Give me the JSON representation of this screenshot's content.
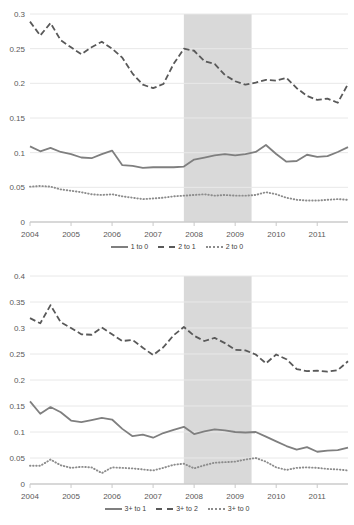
{
  "chart_data": [
    {
      "type": "line",
      "title": "",
      "xlabel": "",
      "ylabel": "",
      "xlim": [
        2004.0,
        2011.75
      ],
      "ylim": [
        0,
        0.3
      ],
      "yticks": [
        "0",
        "0.05",
        "0.1",
        "0.15",
        "0.2",
        "0.25",
        "0.3"
      ],
      "ytick_values": [
        0,
        0.05,
        0.1,
        0.15,
        0.2,
        0.25,
        0.3
      ],
      "xticks": [
        "2004",
        "2005",
        "2006",
        "2007",
        "2008",
        "2009",
        "2010",
        "2011"
      ],
      "xtick_values": [
        2004,
        2005,
        2006,
        2007,
        2008,
        2009,
        2010,
        2011
      ],
      "grid": "horizontal",
      "legend_position": "bottom",
      "shaded_region": {
        "start": 2007.75,
        "end": 2009.4,
        "color": "#d9d9d9"
      },
      "x": [
        2004.0,
        2004.25,
        2004.5,
        2004.75,
        2005.0,
        2005.25,
        2005.5,
        2005.75,
        2006.0,
        2006.25,
        2006.5,
        2006.75,
        2007.0,
        2007.25,
        2007.5,
        2007.75,
        2008.0,
        2008.25,
        2008.5,
        2008.75,
        2009.0,
        2009.25,
        2009.5,
        2009.75,
        2010.0,
        2010.25,
        2010.5,
        2010.75,
        2011.0,
        2011.25,
        2011.5,
        2011.75
      ],
      "series": [
        {
          "name": "1 to 0",
          "style": "solid",
          "color": "#7f7f7f",
          "values": [
            0.109,
            0.102,
            0.107,
            0.101,
            0.098,
            0.093,
            0.092,
            0.098,
            0.103,
            0.082,
            0.081,
            0.078,
            0.079,
            0.079,
            0.079,
            0.08,
            0.09,
            0.093,
            0.096,
            0.098,
            0.096,
            0.098,
            0.101,
            0.111,
            0.098,
            0.087,
            0.088,
            0.097,
            0.094,
            0.095,
            0.101,
            0.108
          ]
        },
        {
          "name": "2 to 1",
          "style": "dashed",
          "color": "#595959",
          "values": [
            0.289,
            0.269,
            0.287,
            0.262,
            0.252,
            0.242,
            0.252,
            0.26,
            0.25,
            0.237,
            0.214,
            0.198,
            0.193,
            0.199,
            0.228,
            0.25,
            0.247,
            0.232,
            0.228,
            0.212,
            0.203,
            0.198,
            0.201,
            0.205,
            0.204,
            0.208,
            0.193,
            0.182,
            0.176,
            0.178,
            0.172,
            0.199
          ]
        },
        {
          "name": "2 to 0",
          "style": "dotted",
          "color": "#8c8c8c",
          "values": [
            0.051,
            0.052,
            0.051,
            0.047,
            0.045,
            0.043,
            0.04,
            0.039,
            0.04,
            0.037,
            0.035,
            0.033,
            0.034,
            0.035,
            0.037,
            0.038,
            0.039,
            0.04,
            0.038,
            0.039,
            0.038,
            0.038,
            0.039,
            0.043,
            0.04,
            0.035,
            0.032,
            0.031,
            0.031,
            0.032,
            0.033,
            0.032
          ]
        }
      ]
    },
    {
      "type": "line",
      "title": "",
      "xlabel": "",
      "ylabel": "",
      "xlim": [
        2004.0,
        2011.75
      ],
      "ylim": [
        0,
        0.4
      ],
      "yticks": [
        "0",
        "0.05",
        "0.1",
        "0.15",
        "0.2",
        "0.25",
        "0.3",
        "0.35",
        "0.4"
      ],
      "ytick_values": [
        0,
        0.05,
        0.1,
        0.15,
        0.2,
        0.25,
        0.3,
        0.35,
        0.4
      ],
      "xticks": [
        "2004",
        "2005",
        "2006",
        "2007",
        "2008",
        "2009",
        "2010",
        "2011"
      ],
      "xtick_values": [
        2004,
        2005,
        2006,
        2007,
        2008,
        2009,
        2010,
        2011
      ],
      "grid": "horizontal",
      "legend_position": "bottom",
      "shaded_region": {
        "start": 2007.75,
        "end": 2009.4,
        "color": "#d9d9d9"
      },
      "x": [
        2004.0,
        2004.25,
        2004.5,
        2004.75,
        2005.0,
        2005.25,
        2005.5,
        2005.75,
        2006.0,
        2006.25,
        2006.5,
        2006.75,
        2007.0,
        2007.25,
        2007.5,
        2007.75,
        2008.0,
        2008.25,
        2008.5,
        2008.75,
        2009.0,
        2009.25,
        2009.5,
        2009.75,
        2010.0,
        2010.25,
        2010.5,
        2010.75,
        2011.0,
        2011.25,
        2011.5,
        2011.75
      ],
      "series": [
        {
          "name": "3+ to 1",
          "style": "solid",
          "color": "#7f7f7f",
          "values": [
            0.159,
            0.135,
            0.148,
            0.138,
            0.122,
            0.119,
            0.123,
            0.127,
            0.124,
            0.106,
            0.092,
            0.095,
            0.089,
            0.098,
            0.104,
            0.11,
            0.096,
            0.101,
            0.105,
            0.103,
            0.1,
            0.099,
            0.1,
            0.091,
            0.082,
            0.073,
            0.066,
            0.071,
            0.062,
            0.064,
            0.065,
            0.07
          ]
        },
        {
          "name": "3+ to 2",
          "style": "dashed",
          "color": "#595959",
          "values": [
            0.319,
            0.309,
            0.344,
            0.311,
            0.3,
            0.288,
            0.287,
            0.301,
            0.288,
            0.275,
            0.277,
            0.262,
            0.248,
            0.263,
            0.286,
            0.302,
            0.285,
            0.275,
            0.281,
            0.271,
            0.258,
            0.257,
            0.249,
            0.232,
            0.249,
            0.24,
            0.221,
            0.217,
            0.218,
            0.216,
            0.219,
            0.236
          ]
        },
        {
          "name": "3+ to 0",
          "style": "dotted",
          "color": "#8c8c8c",
          "values": [
            0.035,
            0.035,
            0.047,
            0.036,
            0.031,
            0.033,
            0.032,
            0.021,
            0.032,
            0.031,
            0.03,
            0.028,
            0.026,
            0.031,
            0.037,
            0.039,
            0.03,
            0.036,
            0.041,
            0.042,
            0.043,
            0.047,
            0.05,
            0.043,
            0.032,
            0.027,
            0.031,
            0.032,
            0.031,
            0.029,
            0.028,
            0.026
          ]
        }
      ]
    }
  ],
  "panels": [
    {
      "legend": [
        {
          "label": "1 to 0",
          "style": "solid"
        },
        {
          "label": "2 to 1",
          "style": "dashed"
        },
        {
          "label": "2 to 0",
          "style": "dotted"
        }
      ]
    },
    {
      "legend": [
        {
          "label": "3+ to 1",
          "style": "solid"
        },
        {
          "label": "3+ to 2",
          "style": "dashed"
        },
        {
          "label": "3+ to 0",
          "style": "dotted"
        }
      ]
    }
  ]
}
